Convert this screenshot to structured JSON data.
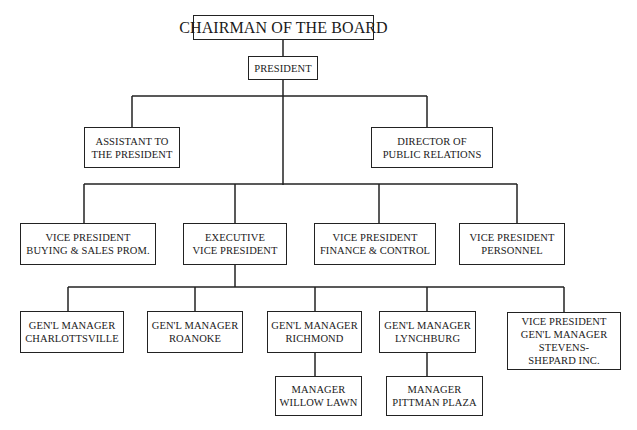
{
  "org_chart": {
    "chairman": {
      "lines": [
        "CHAIRMAN OF THE BOARD"
      ]
    },
    "president": {
      "lines": [
        "PRESIDENT"
      ]
    },
    "staff": [
      {
        "id": "assistant",
        "lines": [
          "ASSISTANT TO",
          "THE PRESIDENT"
        ]
      },
      {
        "id": "public-relations",
        "lines": [
          "DIRECTOR OF",
          "PUBLIC RELATIONS"
        ]
      }
    ],
    "vice_presidents": [
      {
        "id": "vp-buying",
        "lines": [
          "VICE PRESIDENT",
          "BUYING & SALES PROM."
        ]
      },
      {
        "id": "exec-vp",
        "lines": [
          "EXECUTIVE",
          "VICE PRESIDENT"
        ]
      },
      {
        "id": "vp-finance",
        "lines": [
          "VICE PRESIDENT",
          "FINANCE & CONTROL"
        ]
      },
      {
        "id": "vp-personnel",
        "lines": [
          "VICE PRESIDENT",
          "PERSONNEL"
        ]
      }
    ],
    "general_managers": [
      {
        "id": "gm-charlottesville",
        "lines": [
          "GEN'L MANAGER",
          "CHARLOTTSVILLE"
        ]
      },
      {
        "id": "gm-roanoke",
        "lines": [
          "GEN'L MANAGER",
          "ROANOKE"
        ]
      },
      {
        "id": "gm-richmond",
        "lines": [
          "GEN'L MANAGER",
          "RICHMOND"
        ]
      },
      {
        "id": "gm-lynchburg",
        "lines": [
          "GEN'L MANAGER",
          "LYNCHBURG"
        ]
      },
      {
        "id": "vp-gm-stevens",
        "lines": [
          "VICE PRESIDENT",
          "GEN'L MANAGER",
          "STEVENS-",
          "SHEPARD INC."
        ]
      }
    ],
    "managers": [
      {
        "id": "mgr-willow-lawn",
        "parent": "gm-richmond",
        "lines": [
          "MANAGER",
          "WILLOW LAWN"
        ]
      },
      {
        "id": "mgr-pittman-plaza",
        "parent": "gm-lynchburg",
        "lines": [
          "MANAGER",
          "PITTMAN PLAZA"
        ]
      }
    ]
  }
}
